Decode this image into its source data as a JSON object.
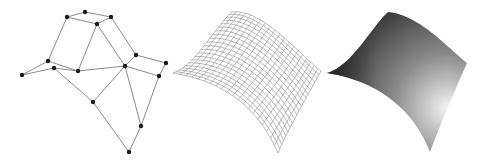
{
  "figure": {
    "panels": [
      {
        "id": "control-net",
        "kind": "control-polygon",
        "line_color": "#8a8a8a",
        "point_color": "#1a1a1a",
        "points": [
          [
            67,
            17
          ],
          [
            85,
            12
          ],
          [
            111,
            17
          ],
          [
            97,
            24
          ],
          [
            48,
            61
          ],
          [
            22,
            75
          ],
          [
            54,
            68
          ],
          [
            78,
            71
          ],
          [
            125,
            66
          ],
          [
            136,
            55
          ],
          [
            166,
            63
          ],
          [
            159,
            76
          ],
          [
            93,
            102
          ],
          [
            141,
            126
          ],
          [
            129,
            152
          ]
        ],
        "edges": [
          [
            0,
            1
          ],
          [
            1,
            2
          ],
          [
            0,
            3
          ],
          [
            2,
            3
          ],
          [
            0,
            4
          ],
          [
            4,
            5
          ],
          [
            4,
            7
          ],
          [
            5,
            6
          ],
          [
            6,
            7
          ],
          [
            3,
            7
          ],
          [
            3,
            8
          ],
          [
            2,
            9
          ],
          [
            7,
            8
          ],
          [
            8,
            9
          ],
          [
            9,
            10
          ],
          [
            8,
            11
          ],
          [
            10,
            11
          ],
          [
            6,
            12
          ],
          [
            8,
            12
          ],
          [
            12,
            14
          ],
          [
            11,
            13
          ],
          [
            13,
            14
          ],
          [
            8,
            13
          ]
        ]
      },
      {
        "id": "wireframe-surface",
        "kind": "wireframe",
        "line_color": "#9a9a9a",
        "grid": 20,
        "control_points": [
          [
            [
              173,
              73
            ],
            [
              195,
              66
            ],
            [
              214,
              28
            ],
            [
              232,
              12
            ]
          ],
          [
            [
              215,
              80
            ],
            [
              228,
              60
            ],
            [
              250,
              25
            ],
            [
              262,
              8
            ]
          ],
          [
            [
              255,
              100
            ],
            [
              270,
              90
            ],
            [
              292,
              70
            ],
            [
              300,
              55
            ]
          ],
          [
            [
              278,
              153
            ],
            [
              290,
              125
            ],
            [
              308,
              95
            ],
            [
              321,
              71
            ]
          ]
        ]
      },
      {
        "id": "shaded-surface",
        "kind": "shaded",
        "dark_color": "#2e2e2e",
        "mid_color": "#6b6b6b",
        "highlight_color": "#f4f4f4",
        "highlight_center": [
          447,
          108
        ],
        "control_points": [
          [
            [
              327,
              73
            ],
            [
              352,
              66
            ],
            [
              372,
              26
            ],
            [
              388,
              12
            ]
          ],
          [
            [
              370,
              80
            ],
            [
              385,
              60
            ],
            [
              410,
              22
            ],
            [
              420,
              14
            ]
          ],
          [
            [
              410,
              102
            ],
            [
              425,
              90
            ],
            [
              448,
              66
            ],
            [
              455,
              55
            ]
          ],
          [
            [
              430,
              152
            ],
            [
              440,
              125
            ],
            [
              455,
              90
            ],
            [
              467,
              63
            ]
          ]
        ]
      }
    ]
  }
}
